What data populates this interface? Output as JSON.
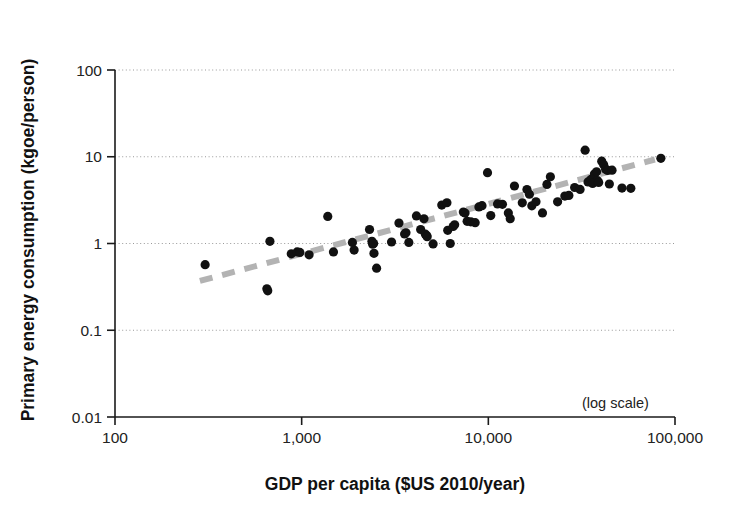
{
  "figure": {
    "annotation": "(log scale)"
  },
  "axes": {
    "y": {
      "title": "Primary energy consumption (kgoe/person)",
      "ticks": [
        "100",
        "10",
        "1",
        "0.1",
        "0.01"
      ],
      "tick_values": [
        100,
        10,
        1,
        0.1,
        0.01
      ]
    },
    "x": {
      "title": "GDP per capita ($US 2010/year)",
      "ticks": [
        "100",
        "1,000",
        "10,000",
        "100,000"
      ],
      "tick_values": [
        100,
        1000,
        10000,
        100000
      ]
    }
  },
  "style": {
    "point_color": "#111111",
    "trend_color": "#b3b3b3",
    "grid_color": "#999999",
    "axis_color": "#1a1a1a",
    "background": "#ffffff"
  },
  "chart_data": {
    "type": "scatter",
    "title": "",
    "xlabel": "GDP per capita ($US 2010/year)",
    "ylabel": "Primary energy consumption (kgoe/person)",
    "xscale": "log",
    "yscale": "log",
    "xlim": [
      100,
      100000
    ],
    "ylim": [
      0.01,
      100
    ],
    "grid": "horizontal-dotted",
    "legend": null,
    "annotations": [
      {
        "text": "(log scale)",
        "x": 46000,
        "y": 0.018
      }
    ],
    "series": [
      {
        "name": "Countries",
        "marker": "filled-circle",
        "points": [
          [
            304,
            0.57
          ],
          [
            651,
            0.3
          ],
          [
            658,
            0.285
          ],
          [
            676,
            1.06
          ],
          [
            880,
            0.76
          ],
          [
            946,
            0.8
          ],
          [
            978,
            0.79
          ],
          [
            1096,
            0.74
          ],
          [
            1380,
            2.05
          ],
          [
            1480,
            0.8
          ],
          [
            1870,
            1.03
          ],
          [
            1910,
            0.84
          ],
          [
            2310,
            1.45
          ],
          [
            2380,
            1.06
          ],
          [
            2400,
            0.98
          ],
          [
            2430,
            1.0
          ],
          [
            2440,
            0.77
          ],
          [
            2520,
            0.52
          ],
          [
            3030,
            1.04
          ],
          [
            3320,
            1.72
          ],
          [
            3560,
            1.29
          ],
          [
            3620,
            1.33
          ],
          [
            3750,
            1.03
          ],
          [
            4120,
            2.08
          ],
          [
            4340,
            1.45
          ],
          [
            4520,
            1.93
          ],
          [
            4600,
            1.28
          ],
          [
            4680,
            1.23
          ],
          [
            4700,
            1.2
          ],
          [
            5060,
            0.99
          ],
          [
            5630,
            2.77
          ],
          [
            6000,
            2.95
          ],
          [
            6060,
            1.42
          ],
          [
            6250,
            1.0
          ],
          [
            6480,
            1.57
          ],
          [
            6600,
            1.64
          ],
          [
            7350,
            2.3
          ],
          [
            7500,
            2.24
          ],
          [
            7700,
            1.8
          ],
          [
            8060,
            1.78
          ],
          [
            8500,
            1.74
          ],
          [
            8900,
            2.64
          ],
          [
            9250,
            2.73
          ],
          [
            9900,
            6.55
          ],
          [
            10300,
            2.1
          ],
          [
            11200,
            2.86
          ],
          [
            11900,
            2.83
          ],
          [
            12800,
            2.25
          ],
          [
            13100,
            1.93
          ],
          [
            13800,
            4.6
          ],
          [
            15200,
            2.94
          ],
          [
            16100,
            4.18
          ],
          [
            16600,
            3.7
          ],
          [
            17100,
            2.72
          ],
          [
            18000,
            3.03
          ],
          [
            19500,
            2.25
          ],
          [
            20600,
            4.8
          ],
          [
            21500,
            5.88
          ],
          [
            23500,
            3.02
          ],
          [
            25700,
            3.52
          ],
          [
            27000,
            3.58
          ],
          [
            29000,
            4.42
          ],
          [
            31000,
            4.2
          ],
          [
            33000,
            11.9
          ],
          [
            34200,
            5.12
          ],
          [
            35500,
            5.48
          ],
          [
            36200,
            4.92
          ],
          [
            37000,
            6.32
          ],
          [
            38000,
            6.7
          ],
          [
            38500,
            5.3
          ],
          [
            39000,
            5.05
          ],
          [
            40500,
            8.9
          ],
          [
            41500,
            8.1
          ],
          [
            42500,
            7.2
          ],
          [
            43500,
            6.95
          ],
          [
            44500,
            4.85
          ],
          [
            46000,
            7.0
          ],
          [
            52000,
            4.35
          ],
          [
            58000,
            4.32
          ],
          [
            84000,
            9.6
          ]
        ]
      }
    ],
    "trendline": {
      "style": "dashed",
      "color": "#b3b3b3",
      "x0": 285,
      "y0": 0.37,
      "x1": 78000,
      "y1": 9.3
    }
  }
}
